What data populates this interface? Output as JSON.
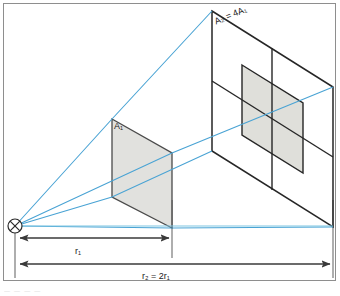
{
  "figure": {
    "labels": {
      "near_plane_label": "A₁",
      "far_plane_label": "A₂ = 4A₁",
      "near_distance_label": "r₁",
      "far_distance_label": "r₂ = 2r₁"
    },
    "caption_fragment": "—  —   —    —",
    "icons": {
      "source_point": "point-source-cross-circle"
    },
    "colors": {
      "ray": "#49a3d4",
      "baseline_ray": "#7fc6e2",
      "plane_outline": "#262626",
      "shaded_fill": "#c9c9c2",
      "guide_line": "#9a9a9a",
      "frame_border": "#8e8e8e",
      "arrow": "#3a3a3a",
      "background": "#ffffff"
    },
    "geometry": {
      "source": {
        "x": 15,
        "y": 226,
        "radius": 7
      },
      "near_plane": {
        "name": "A1",
        "points": "112,119 172,153 172,228 112,197",
        "fill": "#c9c9c2",
        "opacity": 0.55
      },
      "far_plane": {
        "name": "A2",
        "points": "212,11 333,87 333,227 212,151",
        "fill": "none"
      },
      "far_plane_dividers": [
        "272,49 272,189",
        "212,81 333,157"
      ],
      "far_plane_shaded_quadrant": {
        "points": "242,65 303,103 303,173 242,135",
        "fill": "#c9c9c2",
        "opacity": 0.55
      },
      "rays": [
        "15,226 112,119 212,11",
        "15,226 172,153 333,87",
        "15,226 112,197 212,151",
        "15,226 172,228 333,227"
      ],
      "baseline_ray": "15,226 333,226",
      "guides": [
        {
          "x": 15,
          "y1": 226,
          "y2": 278
        },
        {
          "x": 172,
          "y1": 228,
          "y2": 258
        },
        {
          "x": 333,
          "y1": 227,
          "y2": 278
        }
      ],
      "dimension_arrows": [
        {
          "name": "r1",
          "x1": 18,
          "x2": 170,
          "y": 238
        },
        {
          "name": "r2",
          "x1": 18,
          "x2": 331,
          "y": 264
        }
      ]
    }
  }
}
